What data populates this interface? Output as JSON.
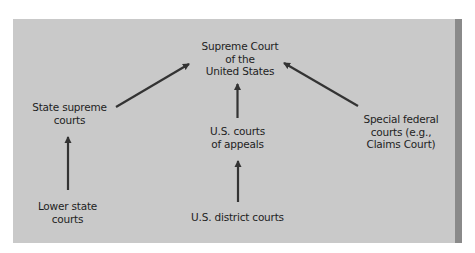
{
  "diagram": {
    "type": "hierarchy-flow",
    "direction": "bottom-to-top",
    "colors": {
      "background": "#c9c9c9",
      "stripe": "#8a8a8a",
      "arrow": "#333333",
      "text": "#1e1e1e"
    },
    "nodes": {
      "supreme_court": {
        "lines": [
          "Supreme Court",
          "of the",
          "United States"
        ]
      },
      "state_supreme": {
        "lines": [
          "State supreme",
          "courts"
        ]
      },
      "courts_of_appeals": {
        "lines": [
          "U.S. courts",
          "of appeals"
        ]
      },
      "special_federal": {
        "lines": [
          "Special federal",
          "courts (e.g.,",
          "Claims Court)"
        ]
      },
      "lower_state": {
        "lines": [
          "Lower state",
          "courts"
        ]
      },
      "district_courts": {
        "lines": [
          "U.S. district courts"
        ]
      }
    },
    "edges": [
      {
        "from": "state_supreme",
        "to": "supreme_court"
      },
      {
        "from": "courts_of_appeals",
        "to": "supreme_court"
      },
      {
        "from": "special_federal",
        "to": "supreme_court"
      },
      {
        "from": "lower_state",
        "to": "state_supreme"
      },
      {
        "from": "district_courts",
        "to": "courts_of_appeals"
      }
    ]
  }
}
